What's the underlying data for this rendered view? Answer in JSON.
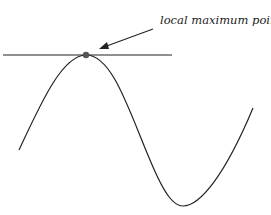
{
  "diagram": {
    "annotation": "local maximum point",
    "elements": [
      "sine-like curve",
      "horizontal tangent line",
      "local maximum point marker",
      "arrow"
    ],
    "colors": {
      "line": "#222222",
      "point": "#555555",
      "background": "#ffffff"
    }
  }
}
